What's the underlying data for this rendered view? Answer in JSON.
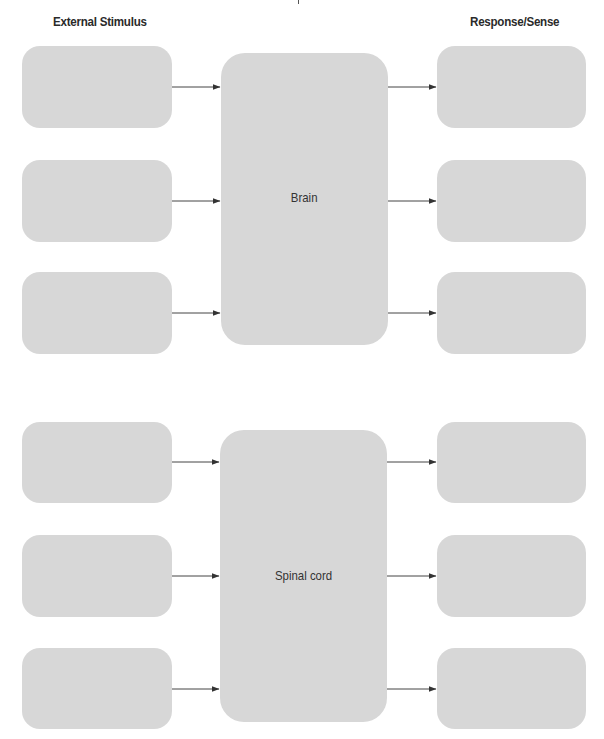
{
  "headers": {
    "left": "External Stimulus",
    "right": "Response/Sense"
  },
  "sections": [
    {
      "center_label": "Brain",
      "stimulus_boxes": [
        "",
        "",
        ""
      ],
      "response_boxes": [
        "",
        "",
        ""
      ]
    },
    {
      "center_label": "Spinal cord",
      "stimulus_boxes": [
        "",
        "",
        ""
      ],
      "response_boxes": [
        "",
        "",
        ""
      ]
    }
  ],
  "colors": {
    "box_fill": "#d7d7d7",
    "arrow": "#333333",
    "header_text": "#2a2a2a"
  }
}
